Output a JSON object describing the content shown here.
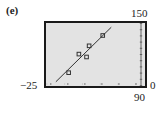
{
  "panel": {
    "label": "(e)"
  },
  "window": {
    "xmin_label": "−25",
    "xmax_label": "90",
    "ymin_label": "0",
    "ymax_label": "150"
  },
  "colors": {
    "screen_bg": "#e3e3e3",
    "frame": "#1a1a1a",
    "line": "#333333",
    "point": "#333333"
  },
  "chart_data": {
    "type": "scatter",
    "title": "(e)",
    "xlabel": "",
    "ylabel": "",
    "xlim": [
      -25,
      90
    ],
    "ylim": [
      0,
      150
    ],
    "grid": false,
    "legend": null,
    "series": [
      {
        "name": "data points",
        "kind": "scatter",
        "marker": "square",
        "points": [
          {
            "x": 1,
            "y": 31
          },
          {
            "x": 13,
            "y": 76
          },
          {
            "x": 22,
            "y": 69
          },
          {
            "x": 25,
            "y": 96
          },
          {
            "x": 41,
            "y": 121
          }
        ]
      },
      {
        "name": "regression line",
        "kind": "line",
        "points": [
          {
            "x": -14,
            "y": 9
          },
          {
            "x": 51,
            "y": 141
          }
        ]
      }
    ],
    "x_ticks_spacing": 20,
    "y_ticks_spacing": 15
  }
}
